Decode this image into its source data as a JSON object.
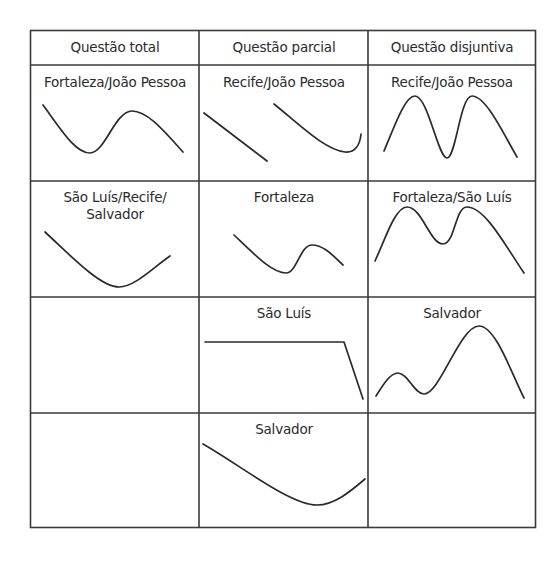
{
  "table": {
    "headers": [
      "Questão total",
      "Questão parcial",
      "Questão disjuntiva"
    ],
    "rows": [
      [
        "Fortaleza/João Pessoa",
        "Recife/João Pessoa",
        "Recife/João Pessoa"
      ],
      [
        "São Luís/Recife/\nSalvador",
        "Fortaleza",
        "Fortaleza/São Luís"
      ],
      [
        "",
        "São Luís",
        "Salvador"
      ],
      [
        "",
        "Salvador",
        ""
      ]
    ]
  },
  "contours": [
    {
      "cell": "r1c1",
      "shape": "fall-rise-fall",
      "path": "M43,105 C60,128 75,153 90,153 C105,153 115,111 132,111 C148,111 165,132 183,152"
    },
    {
      "cell": "r1c2a",
      "shape": "straight-fall",
      "path": "M204,113 L267,161"
    },
    {
      "cell": "r1c2b",
      "shape": "fall-rise",
      "path": "M274,104 C300,125 325,150 345,152 C355,153 360,145 361,134"
    },
    {
      "cell": "r1c3",
      "shape": "rise-fall-rise-fall",
      "path": "M384,151 C395,125 405,96 415,96 C428,96 438,158 447,158 C456,158 460,96 472,96 C486,96 503,133 517,157"
    },
    {
      "cell": "r2c1",
      "shape": "fall-rise",
      "path": "M45,232 C70,255 100,287 119,287 C135,287 155,266 170,256"
    },
    {
      "cell": "r2c2",
      "shape": "fall-rise-fall",
      "path": "M234,235 C255,255 272,273 286,273 C297,273 300,245 312,245 C325,245 335,258 343,265"
    },
    {
      "cell": "r2c3",
      "shape": "rise-fall-rise-fall",
      "path": "M375,261 C385,240 395,207 407,207 C422,207 430,244 443,244 C455,244 455,207 467,207 C485,207 505,245 524,273"
    },
    {
      "cell": "r3c2",
      "shape": "level-fall",
      "path": "M205,342 L344,342 L363,399"
    },
    {
      "cell": "r3c3",
      "shape": "rise-fall-rise-fall",
      "path": "M376,396 C383,385 390,373 398,373 C408,373 414,394 424,394 C440,394 460,326 479,326 C496,326 512,375 524,398"
    },
    {
      "cell": "r4c2",
      "shape": "fall-rise",
      "path": "M203,444 C240,465 290,505 317,505 C335,505 352,490 365,479"
    }
  ],
  "colors": {
    "line": "#2a2a2a",
    "border": "#3a3a3a",
    "background": "#ffffff"
  }
}
